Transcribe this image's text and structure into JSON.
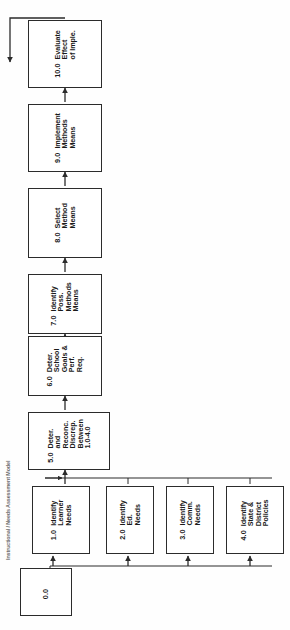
{
  "diagram": {
    "title_label": "Instructional / Needs Assessment Model",
    "orientation": "rotated-90-ccw",
    "stroke_color": "#2b2b2b",
    "background_color": "#fefefe",
    "nodes": [
      {
        "key": "n10",
        "id": "10.0",
        "lines": [
          "Evaluate",
          "Effect",
          "of  Imple."
        ]
      },
      {
        "key": "n9",
        "id": "9.0",
        "lines": [
          "Implement",
          "Methods",
          "Means"
        ]
      },
      {
        "key": "n8",
        "id": "8.0",
        "lines": [
          "Select",
          "Method",
          "Means"
        ]
      },
      {
        "key": "n7",
        "id": "7.0",
        "lines": [
          "Identify",
          "Poss.",
          "Methods",
          "Means"
        ]
      },
      {
        "key": "n6",
        "id": "6.0",
        "lines": [
          "Deter.",
          "School",
          "Goals &",
          "Perf.",
          "Req."
        ]
      },
      {
        "key": "n5",
        "id": "5.0",
        "lines": [
          "Deter.",
          "and",
          "Reconc.",
          "Discrep.",
          "Between",
          "1.0-4.0"
        ]
      },
      {
        "key": "n1",
        "id": "1.0",
        "lines": [
          "Identify",
          "Learner",
          "Needs"
        ]
      },
      {
        "key": "n2",
        "id": "2.0",
        "lines": [
          "Identify",
          "Ed.",
          "Needs"
        ]
      },
      {
        "key": "n3",
        "id": "3.0",
        "lines": [
          "Identify",
          "Comm.",
          "Needs"
        ]
      },
      {
        "key": "n4",
        "id": "4.0",
        "lines": [
          "Identify",
          "State &",
          "District",
          "Policies"
        ]
      },
      {
        "key": "n0",
        "id": "0.0",
        "lines": []
      }
    ],
    "connections": [
      {
        "from": "0.0",
        "to": "1.0"
      },
      {
        "from": "0.0",
        "to": "2.0"
      },
      {
        "from": "0.0",
        "to": "3.0"
      },
      {
        "from": "0.0",
        "to": "4.0"
      },
      {
        "from": "1.0",
        "to": "5.0"
      },
      {
        "from": "2.0",
        "to": "5.0"
      },
      {
        "from": "3.0",
        "to": "5.0"
      },
      {
        "from": "4.0",
        "to": "5.0"
      },
      {
        "from": "5.0",
        "to": "6.0"
      },
      {
        "from": "6.0",
        "to": "7.0"
      },
      {
        "from": "7.0",
        "to": "8.0"
      },
      {
        "from": "8.0",
        "to": "9.0"
      },
      {
        "from": "9.0",
        "to": "10.0"
      },
      {
        "from": "10.0",
        "to": "feedback-loop"
      }
    ]
  }
}
